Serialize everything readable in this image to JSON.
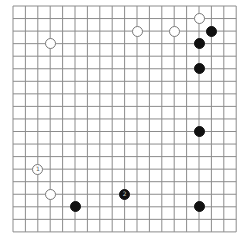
{
  "board": {
    "size": 19,
    "origin_x": 13,
    "origin_y": 6,
    "step_x": 12.4,
    "step_y": 12.55,
    "line_color": "#8c8c8c",
    "background": "#ffffff",
    "stone_diameter": 11
  },
  "stones": [
    {
      "color": "white",
      "col": 3,
      "row": 3,
      "label": ""
    },
    {
      "color": "white",
      "col": 10,
      "row": 2,
      "label": ""
    },
    {
      "color": "white",
      "col": 13,
      "row": 2,
      "label": ""
    },
    {
      "color": "white",
      "col": 15,
      "row": 1,
      "label": ""
    },
    {
      "color": "black",
      "col": 16,
      "row": 2,
      "label": ""
    },
    {
      "color": "black",
      "col": 15,
      "row": 3,
      "label": ""
    },
    {
      "color": "black",
      "col": 15,
      "row": 5,
      "label": ""
    },
    {
      "color": "black",
      "col": 15,
      "row": 10,
      "label": ""
    },
    {
      "color": "white",
      "col": 2,
      "row": 13,
      "label": "1"
    },
    {
      "color": "white",
      "col": 3,
      "row": 15,
      "label": ""
    },
    {
      "color": "black",
      "col": 5,
      "row": 16,
      "label": ""
    },
    {
      "color": "black",
      "col": 9,
      "row": 15,
      "label": "2"
    },
    {
      "color": "black",
      "col": 15,
      "row": 16,
      "label": ""
    }
  ]
}
